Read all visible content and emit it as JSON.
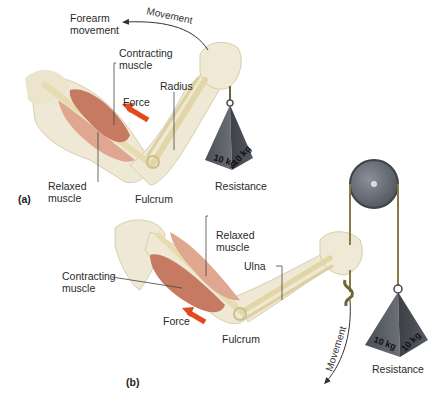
{
  "figure": {
    "panel_a": {
      "id": "(a)",
      "labels": {
        "forearm_movement_1": "Forearm",
        "forearm_movement_2": "movement",
        "movement": "Movement",
        "contracting_1": "Contracting",
        "contracting_2": "muscle",
        "radius": "Radius",
        "force": "Force",
        "relaxed_1": "Relaxed",
        "relaxed_2": "muscle",
        "fulcrum": "Fulcrum",
        "resistance": "Resistance",
        "weight_left": "10 kg",
        "weight_right": "10 kg"
      }
    },
    "panel_b": {
      "id": "(b)",
      "labels": {
        "relaxed_1": "Relaxed",
        "relaxed_2": "muscle",
        "ulna": "Ulna",
        "contracting_1": "Contracting",
        "contracting_2": "muscle",
        "force": "Force",
        "fulcrum": "Fulcrum",
        "movement": "Movement",
        "resistance": "Resistance",
        "weight_left": "10 kg",
        "weight_right": "10 kg"
      }
    },
    "colors": {
      "skin": "#efe8d4",
      "bone": "#e6dcb0",
      "muscle": "#c77a62",
      "muscle_light": "#dfa690",
      "force_arrow": "#e24a1c",
      "weight": "#555a60",
      "pulley": "#6b7078",
      "rope": "#8a7a45"
    }
  }
}
